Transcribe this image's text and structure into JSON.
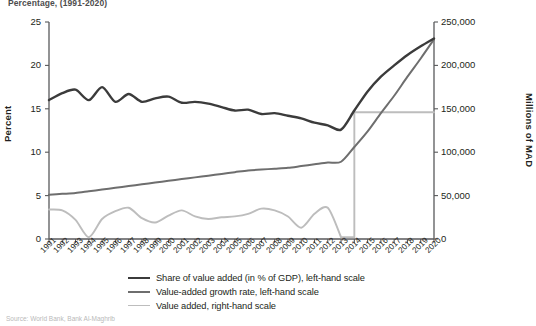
{
  "figure": {
    "title": "Percentage, (1991-2020)",
    "source_note": "Source: World Bank, Bank Al-Maghrib"
  },
  "axes": {
    "left": {
      "label": "Percent",
      "ticks": [
        "25",
        "20",
        "15",
        "10",
        "5",
        "0"
      ],
      "min": 0,
      "max": 25
    },
    "right": {
      "label": "Millions of MAD",
      "ticks": [
        "250,000",
        "200,000",
        "150,000",
        "100,000",
        "50,000",
        "0"
      ],
      "min": 0,
      "max": 250000
    },
    "x": {
      "ticks": [
        "1991",
        "1992",
        "1993",
        "1994",
        "1995",
        "1996",
        "1997",
        "1998",
        "1999",
        "2000",
        "2001",
        "2002",
        "2003",
        "2004",
        "2005",
        "2006",
        "2007",
        "2008",
        "2009",
        "2010",
        "2011",
        "2012",
        "2013",
        "2014",
        "2015",
        "2016",
        "2017",
        "2018",
        "2019",
        "2020"
      ]
    }
  },
  "legend": {
    "items": [
      {
        "label": "Share of value added (in % of GDP), left-hand scale",
        "color": "#3b3b3b",
        "width": 2.6
      },
      {
        "label": "Value-added growth rate, left-hand scale",
        "color": "#6e6e6e",
        "width": 2.2
      },
      {
        "label": "Value added, right-hand scale",
        "color": "#bdbdbd",
        "width": 1.8
      }
    ]
  },
  "colors": {
    "share_line": "#3b3b3b",
    "growth_line": "#6e6e6e",
    "value_added_line": "#bdbdbd",
    "axis": "#58595b",
    "background": "#ffffff"
  },
  "chart_data": {
    "type": "line",
    "title": "Percentage, (1991-2020)",
    "xlabel": "",
    "ylabel": "Percent",
    "y2label": "Millions of MAD",
    "ylim": [
      0,
      25
    ],
    "y2lim": [
      0,
      250000
    ],
    "grid": false,
    "legend_position": "bottom",
    "x": [
      "1991",
      "1992",
      "1993",
      "1994",
      "1995",
      "1996",
      "1997",
      "1998",
      "1999",
      "2000",
      "2001",
      "2002",
      "2003",
      "2004",
      "2005",
      "2006",
      "2007",
      "2008",
      "2009",
      "2010",
      "2011",
      "2012",
      "2013",
      "2014",
      "2015",
      "2016",
      "2017",
      "2018",
      "2019",
      "2020"
    ],
    "series": [
      {
        "name": "Share of value added (in % of GDP), left-hand scale",
        "axis": "left",
        "color": "#3b3b3b",
        "values": [
          16.0,
          16.8,
          17.2,
          16.0,
          17.5,
          15.8,
          16.7,
          15.8,
          16.2,
          16.4,
          15.7,
          15.8,
          15.6,
          15.2,
          14.8,
          14.9,
          14.4,
          14.5,
          14.2,
          13.9,
          13.4,
          13.1,
          12.6,
          14.8,
          17.0,
          18.7,
          20.0,
          21.2,
          22.2,
          23.1
        ]
      },
      {
        "name": "Value-added growth rate, left-hand scale",
        "axis": "left",
        "color": "#6e6e6e",
        "values": [
          5.1,
          5.2,
          5.3,
          5.5,
          5.7,
          5.9,
          6.1,
          6.3,
          6.5,
          6.7,
          6.9,
          7.1,
          7.3,
          7.5,
          7.7,
          7.9,
          8.0,
          8.1,
          8.2,
          8.4,
          8.6,
          8.8,
          8.9,
          10.6,
          12.4,
          14.5,
          16.5,
          18.7,
          20.8,
          23.0
        ]
      },
      {
        "name": "Value added, right-hand scale",
        "axis": "right",
        "color": "#bdbdbd",
        "values": [
          34000,
          33000,
          22000,
          2000,
          23000,
          32000,
          36000,
          24000,
          19000,
          27000,
          33000,
          26000,
          23000,
          25000,
          26000,
          29000,
          35000,
          33000,
          26000,
          13000,
          29000,
          36000,
          2000,
          146000,
          146000,
          146000,
          146000,
          146000,
          146000,
          146000
        ]
      }
    ]
  }
}
